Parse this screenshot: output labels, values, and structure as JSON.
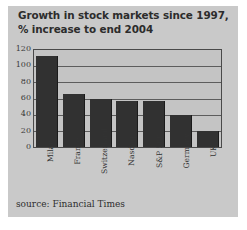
{
  "chart_data": {
    "type": "bar",
    "title": "Growth in stock markets since 1997, % increase to end 2004",
    "title_lines": [
      "Growth in stock markets since 1997,",
      "% increase to end 2004"
    ],
    "categories": [
      "Milan",
      "France",
      "Switzerland",
      "Nasdaq",
      "S&P 500",
      "Germany",
      "UK"
    ],
    "values": [
      112,
      66,
      59,
      57,
      57,
      40,
      20
    ],
    "xlabel": "",
    "ylabel": "",
    "ylim": [
      0,
      120
    ],
    "yticks": [
      0,
      20,
      40,
      60,
      80,
      100,
      120
    ],
    "ytick_labels": [
      "0",
      "20",
      "40",
      "60",
      "80",
      "100",
      "120"
    ],
    "grid": true,
    "grid_axis": "y",
    "legend": false,
    "source": "source: Financial Times",
    "colors": {
      "bar": "#313131",
      "panel": "#c9c9c9",
      "plot_background": "#c4c4c4",
      "gridline": "#5d5d5d",
      "axis": "#4a4a4a",
      "title_text": "#2c2c2c",
      "tick_text": "#3a3a3a"
    }
  }
}
